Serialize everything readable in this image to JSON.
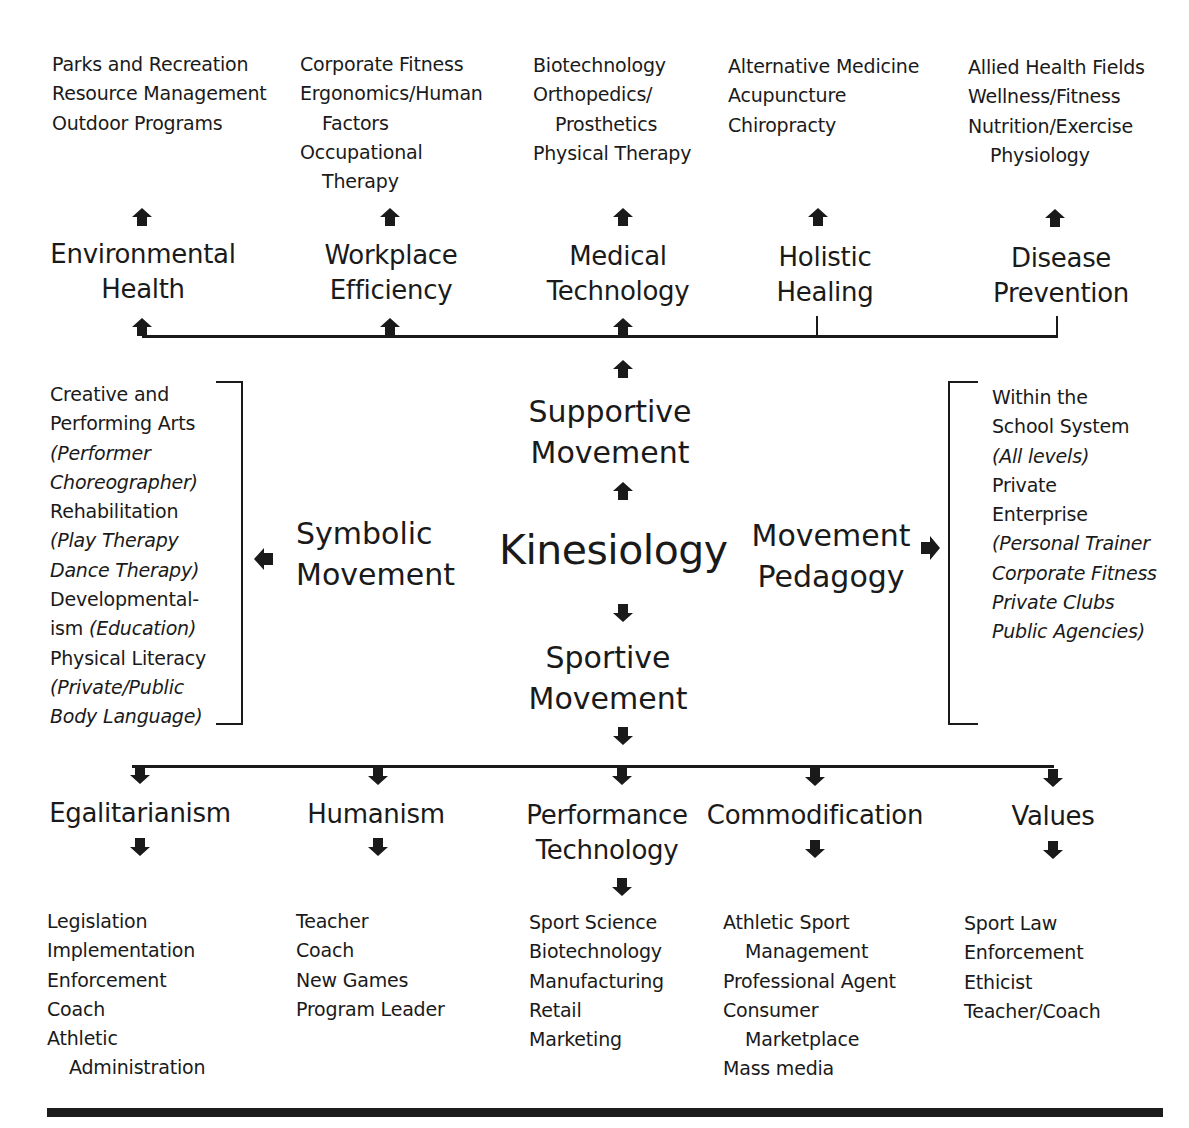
{
  "top_outcomes": [
    {
      "lines": [
        {
          "t": "Parks and Recreation"
        },
        {
          "t": "Resource Management"
        },
        {
          "t": "Outdoor Programs"
        }
      ]
    },
    {
      "lines": [
        {
          "t": "Corporate Fitness"
        },
        {
          "t": "Ergonomics/Human"
        },
        {
          "t": "Factors",
          "indent": true
        },
        {
          "t": "Occupational"
        },
        {
          "t": "Therapy",
          "indent": true
        }
      ]
    },
    {
      "lines": [
        {
          "t": "Biotechnology"
        },
        {
          "t": "Orthopedics/"
        },
        {
          "t": "Prosthetics",
          "indent": true
        },
        {
          "t": "Physical Therapy"
        }
      ]
    },
    {
      "lines": [
        {
          "t": "Alternative Medicine"
        },
        {
          "t": "Acupuncture"
        },
        {
          "t": "Chiropracty"
        }
      ]
    },
    {
      "lines": [
        {
          "t": "Allied Health Fields"
        },
        {
          "t": "Wellness/Fitness"
        },
        {
          "t": "Nutrition/Exercise"
        },
        {
          "t": "Physiology",
          "indent": true
        }
      ]
    }
  ],
  "top_categories": [
    {
      "line1": "Environmental",
      "line2": "Health"
    },
    {
      "line1": "Workplace",
      "line2": "Efficiency"
    },
    {
      "line1": "Medical",
      "line2": "Technology"
    },
    {
      "line1": "Holistic",
      "line2": "Healing"
    },
    {
      "line1": "Disease",
      "line2": "Prevention"
    }
  ],
  "center": {
    "title": "Kinesiology",
    "supportive": {
      "line1": "Supportive",
      "line2": "Movement"
    },
    "sportive": {
      "line1": "Sportive",
      "line2": "Movement"
    },
    "symbolic": {
      "line1": "Symbolic",
      "line2": "Movement"
    },
    "pedagogy": {
      "line1": "Movement",
      "line2": "Pedagogy"
    }
  },
  "symbolic_outcomes": [
    {
      "parts": [
        {
          "t": "Creative and"
        }
      ]
    },
    {
      "parts": [
        {
          "t": "Performing Arts"
        }
      ]
    },
    {
      "parts": [
        {
          "t": "(Performer",
          "italic": true
        }
      ]
    },
    {
      "parts": [
        {
          "t": "Choreographer)",
          "italic": true
        }
      ]
    },
    {
      "parts": [
        {
          "t": "Rehabilitation"
        }
      ]
    },
    {
      "parts": [
        {
          "t": "(Play Therapy",
          "italic": true
        }
      ]
    },
    {
      "parts": [
        {
          "t": "Dance Therapy)",
          "italic": true
        }
      ]
    },
    {
      "parts": [
        {
          "t": "Developmental-"
        }
      ]
    },
    {
      "parts": [
        {
          "t": "ism "
        },
        {
          "t": "(Education)",
          "italic": true
        }
      ]
    },
    {
      "parts": [
        {
          "t": "Physical Literacy"
        }
      ]
    },
    {
      "parts": [
        {
          "t": "(Private/Public",
          "italic": true
        }
      ]
    },
    {
      "parts": [
        {
          "t": "Body Language)",
          "italic": true
        }
      ]
    }
  ],
  "pedagogy_outcomes": [
    {
      "t": "Within the"
    },
    {
      "t": "School System"
    },
    {
      "t": "(All levels)",
      "italic": true
    },
    {
      "t": "Private"
    },
    {
      "t": "Enterprise"
    },
    {
      "t": "(Personal Trainer",
      "italic": true
    },
    {
      "t": "Corporate Fitness",
      "italic": true
    },
    {
      "t": "Private Clubs",
      "italic": true
    },
    {
      "t": "Public Agencies)",
      "italic": true
    }
  ],
  "bottom_categories": [
    {
      "line1": "Egalitarianism",
      "line2": ""
    },
    {
      "line1": "Humanism",
      "line2": ""
    },
    {
      "line1": "Performance",
      "line2": "Technology"
    },
    {
      "line1": "Commodification",
      "line2": ""
    },
    {
      "line1": "Values",
      "line2": ""
    }
  ],
  "bottom_outcomes": [
    {
      "lines": [
        {
          "t": "Legislation"
        },
        {
          "t": "Implementation"
        },
        {
          "t": "Enforcement"
        },
        {
          "t": "Coach"
        },
        {
          "t": "Athletic"
        },
        {
          "t": "Administration",
          "indent": true
        }
      ]
    },
    {
      "lines": [
        {
          "t": "Teacher"
        },
        {
          "t": "Coach"
        },
        {
          "t": "New Games"
        },
        {
          "t": "Program Leader"
        }
      ]
    },
    {
      "lines": [
        {
          "t": "Sport Science"
        },
        {
          "t": "Biotechnology"
        },
        {
          "t": "Manufacturing"
        },
        {
          "t": "Retail"
        },
        {
          "t": "Marketing"
        }
      ]
    },
    {
      "lines": [
        {
          "t": "Athletic Sport"
        },
        {
          "t": "Management",
          "indent": true
        },
        {
          "t": "Professional Agent"
        },
        {
          "t": "Consumer"
        },
        {
          "t": "Marketplace",
          "indent": true
        },
        {
          "t": "Mass media"
        }
      ]
    },
    {
      "lines": [
        {
          "t": "Sport Law"
        },
        {
          "t": "Enforcement"
        },
        {
          "t": "Ethicist"
        },
        {
          "t": "Teacher/Coach"
        }
      ]
    }
  ],
  "colors": {
    "ink": "#1a1a1a",
    "background": "#ffffff"
  }
}
